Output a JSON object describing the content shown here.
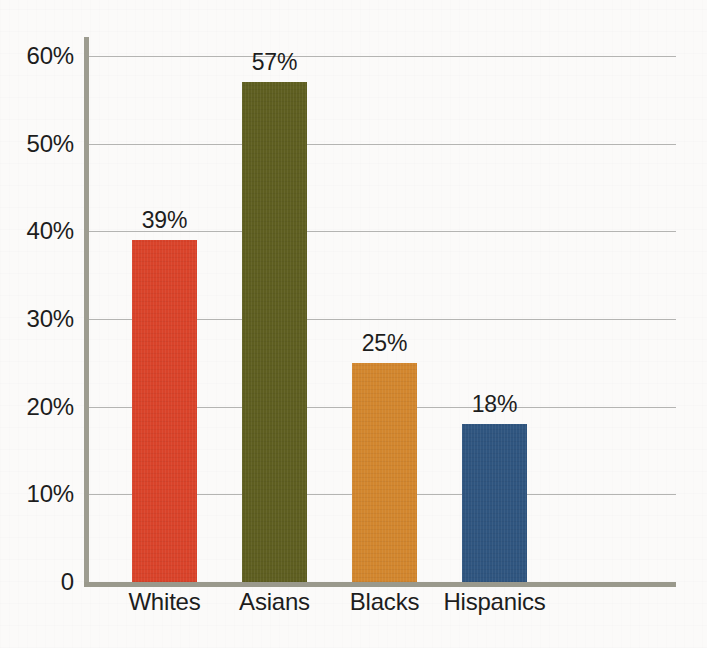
{
  "chart_data": {
    "type": "bar",
    "title": "",
    "subtitle": "",
    "xlabel": "",
    "ylabel": "",
    "categories": [
      "Whites",
      "Asians",
      "Blacks",
      "Hispanics"
    ],
    "values": [
      39,
      57,
      25,
      18
    ],
    "value_labels": [
      "39%",
      "57%",
      "25%",
      "18%"
    ],
    "ylim": [
      0,
      60
    ],
    "y_ticks": [
      0,
      10,
      20,
      30,
      40,
      50,
      60
    ],
    "y_tick_labels": [
      "0",
      "10%",
      "20%",
      "30%",
      "40%",
      "50%",
      "60%"
    ],
    "grid": true,
    "grid_axis": "y",
    "legend": false,
    "legend_position": "none",
    "bar_colors": [
      "#d9432a",
      "#5e5e20",
      "#d2862e",
      "#2f557f"
    ],
    "series": [
      {
        "name": "",
        "values": [
          39,
          57,
          25,
          18
        ]
      }
    ]
  },
  "style": {
    "background": "#fbfaf9",
    "axis_color": "#9a998c",
    "gridline_color": "#b4b4b2",
    "text_color": "#1d1d1d"
  }
}
